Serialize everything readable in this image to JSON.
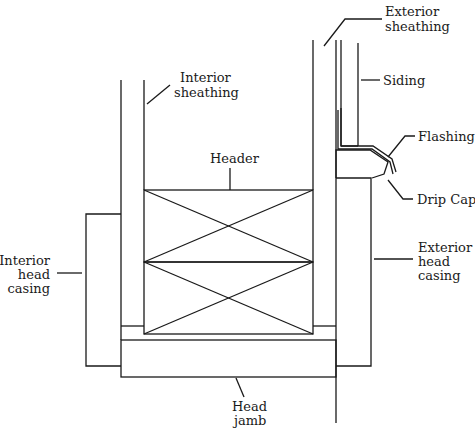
{
  "diagram": {
    "labels": {
      "exterior_sheathing": [
        "Exterior",
        "sheathing"
      ],
      "siding": [
        "Siding"
      ],
      "interior_sheathing": [
        "Interior",
        "sheathing"
      ],
      "flashing": [
        "Flashing"
      ],
      "header": [
        "Header"
      ],
      "drip_cap": [
        "Drip Cap"
      ],
      "interior_head_casing": [
        "Interior",
        "head",
        "casing"
      ],
      "exterior_head_casing": [
        "Exterior",
        "head",
        "casing"
      ],
      "head_jamb": [
        "Head",
        "jamb"
      ]
    }
  }
}
